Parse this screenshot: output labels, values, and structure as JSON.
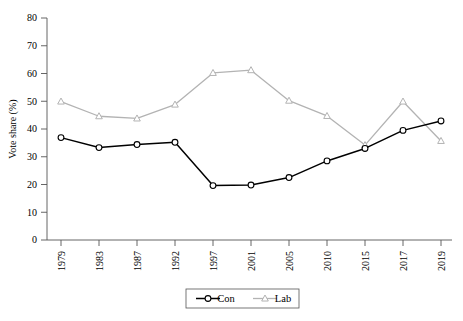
{
  "chart_data": {
    "type": "line",
    "title": "",
    "xlabel": "",
    "ylabel": "Vote share (%)",
    "categories": [
      "1979",
      "1983",
      "1987",
      "1992",
      "1997",
      "2001",
      "2005",
      "2010",
      "2015",
      "2017",
      "2019"
    ],
    "x": [
      1979,
      1983,
      1987,
      1992,
      1997,
      2001,
      2005,
      2010,
      2015,
      2017,
      2019
    ],
    "ylim": [
      0,
      80
    ],
    "yticks": [
      0,
      10,
      20,
      30,
      40,
      50,
      60,
      70,
      80
    ],
    "ytick_labels": [
      "0",
      "10",
      "20",
      "30",
      "40",
      "50",
      "60",
      "70",
      "80"
    ],
    "grid": false,
    "legend_position": "bottom-center",
    "series": [
      {
        "name": "Con",
        "color": "#000000",
        "marker": "circle-open",
        "values": [
          36.9,
          33.3,
          34.4,
          35.2,
          19.6,
          19.8,
          22.5,
          28.5,
          33.0,
          39.5,
          42.9
        ]
      },
      {
        "name": "Lab",
        "color": "#b3b3b3",
        "marker": "triangle-open",
        "values": [
          49.9,
          44.6,
          43.8,
          48.8,
          60.2,
          61.2,
          50.2,
          44.7,
          34.2,
          49.9,
          35.7
        ]
      }
    ]
  },
  "axis": {
    "y_label": "Vote share (%)"
  },
  "legend": {
    "items": [
      {
        "label": "Con"
      },
      {
        "label": "Lab"
      }
    ]
  }
}
